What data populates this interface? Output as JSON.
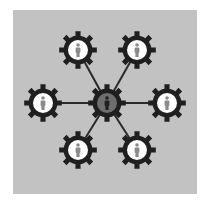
{
  "diagram": {
    "title": "",
    "background_color": "#c2c2c2",
    "gear_color": "#1f1f1f",
    "connector_color": "#2a2a2a",
    "outer_circle_color": "#ffffff",
    "outer_person_color": "#8a8a8a",
    "center_circle_color": "#6e6e6e",
    "center_person_color": "#1f1f1f",
    "hub": {
      "id": "center",
      "x": 94,
      "y": 93,
      "label": ""
    },
    "nodes": [
      {
        "id": "top-left",
        "x": 65,
        "y": 40
      },
      {
        "id": "top-right",
        "x": 124,
        "y": 40
      },
      {
        "id": "left",
        "x": 30,
        "y": 93
      },
      {
        "id": "right",
        "x": 154,
        "y": 93
      },
      {
        "id": "bottom-left",
        "x": 65,
        "y": 140
      },
      {
        "id": "bottom-right",
        "x": 124,
        "y": 140
      }
    ]
  }
}
